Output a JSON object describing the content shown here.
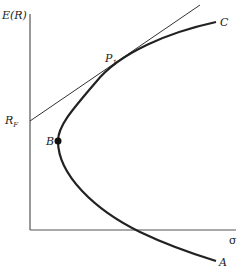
{
  "diagram": {
    "y_axis_label": "E(R)",
    "x_axis_label": "σ",
    "labels": {
      "risk_free": "R",
      "risk_free_sub": "F",
      "tangent_point": "P",
      "tangent_point_sub": "1",
      "min_variance": "B",
      "upper_end": "C",
      "lower_end": "A"
    },
    "colors": {
      "curve": "#222222",
      "axes": "#555555",
      "tangent_line": "#333333",
      "background": "#ffffff"
    }
  }
}
